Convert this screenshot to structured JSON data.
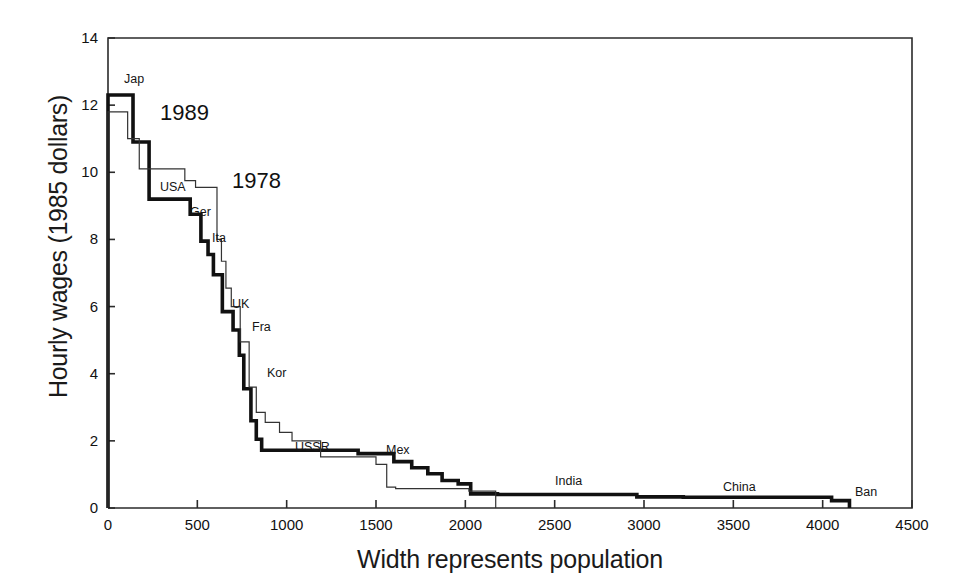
{
  "figure": {
    "background": "#ffffff",
    "frame_color": "#2b2b2b",
    "series_1989_color": "#111111",
    "series_1978_color": "#333333"
  },
  "axes": {
    "y_title": "Hourly wages (1985 dollars)",
    "x_title": "Width represents population",
    "y_ticks": [
      "0",
      "2",
      "4",
      "6",
      "8",
      "10",
      "12",
      "14"
    ],
    "x_ticks": [
      "0",
      "500",
      "1000",
      "1500",
      "2000",
      "2500",
      "3000",
      "3500",
      "4000",
      "4500"
    ]
  },
  "annotations": {
    "series_labels": [
      {
        "text": "1989",
        "x": 160,
        "y": 100
      },
      {
        "text": "1978",
        "x": 232,
        "y": 168
      }
    ],
    "country_labels": [
      {
        "text": "Jap",
        "x": 124,
        "y": 72
      },
      {
        "text": "USA",
        "x": 160,
        "y": 180
      },
      {
        "text": "Ger",
        "x": 190,
        "y": 205
      },
      {
        "text": "Ita",
        "x": 212,
        "y": 231
      },
      {
        "text": "UK",
        "x": 232,
        "y": 297
      },
      {
        "text": "Fra",
        "x": 252,
        "y": 320
      },
      {
        "text": "Kor",
        "x": 267,
        "y": 366
      },
      {
        "text": "USSR",
        "x": 295,
        "y": 440
      },
      {
        "text": "Mex",
        "x": 386,
        "y": 443
      },
      {
        "text": "India",
        "x": 555,
        "y": 474
      },
      {
        "text": "China",
        "x": 723,
        "y": 480
      },
      {
        "text": "Ban",
        "x": 855,
        "y": 485
      }
    ]
  },
  "chart_data": {
    "type": "line",
    "title": "",
    "xlabel": "Width represents population",
    "ylabel": "Hourly wages (1985 dollars)",
    "xlim": [
      0,
      4500
    ],
    "ylim": [
      0,
      14
    ],
    "grid": false,
    "legend": "inline-annotation",
    "note": "Step (staircase) chart. Each horizontal run's width represents that country's population (millions of workers); its height is the hourly wage. Countries are ordered by descending wage.",
    "series": [
      {
        "name": "1989",
        "style": "thick",
        "steps": [
          {
            "label": "Jap",
            "x_start": 0,
            "x_end": 140,
            "wage": 12.3
          },
          {
            "label": "",
            "x_start": 140,
            "x_end": 230,
            "wage": 10.9
          },
          {
            "label": "USA",
            "x_start": 230,
            "x_end": 460,
            "wage": 9.2
          },
          {
            "label": "Ger",
            "x_start": 460,
            "x_end": 520,
            "wage": 8.75
          },
          {
            "label": "Ita",
            "x_start": 520,
            "x_end": 560,
            "wage": 7.95
          },
          {
            "label": "",
            "x_start": 560,
            "x_end": 590,
            "wage": 7.55
          },
          {
            "label": "",
            "x_start": 590,
            "x_end": 640,
            "wage": 6.95
          },
          {
            "label": "UK",
            "x_start": 640,
            "x_end": 700,
            "wage": 5.85
          },
          {
            "label": "Fra",
            "x_start": 700,
            "x_end": 735,
            "wage": 5.3
          },
          {
            "label": "",
            "x_start": 735,
            "x_end": 760,
            "wage": 4.55
          },
          {
            "label": "Kor",
            "x_start": 760,
            "x_end": 800,
            "wage": 3.55
          },
          {
            "label": "",
            "x_start": 800,
            "x_end": 830,
            "wage": 2.6
          },
          {
            "label": "",
            "x_start": 830,
            "x_end": 860,
            "wage": 2.05
          },
          {
            "label": "USSR",
            "x_start": 860,
            "x_end": 1400,
            "wage": 1.72
          },
          {
            "label": "Mex",
            "x_start": 1400,
            "x_end": 1600,
            "wage": 1.62
          },
          {
            "label": "",
            "x_start": 1600,
            "x_end": 1700,
            "wage": 1.38
          },
          {
            "label": "",
            "x_start": 1700,
            "x_end": 1790,
            "wage": 1.2
          },
          {
            "label": "",
            "x_start": 1790,
            "x_end": 1870,
            "wage": 1.02
          },
          {
            "label": "",
            "x_start": 1870,
            "x_end": 1960,
            "wage": 0.82
          },
          {
            "label": "",
            "x_start": 1960,
            "x_end": 2030,
            "wage": 0.72
          },
          {
            "label": "",
            "x_start": 2030,
            "x_end": 2180,
            "wage": 0.42
          },
          {
            "label": "India",
            "x_start": 2180,
            "x_end": 2960,
            "wage": 0.4
          },
          {
            "label": "",
            "x_start": 2960,
            "x_end": 3220,
            "wage": 0.33
          },
          {
            "label": "China",
            "x_start": 3220,
            "x_end": 4050,
            "wage": 0.32
          },
          {
            "label": "Ban",
            "x_start": 4050,
            "x_end": 4150,
            "wage": 0.22
          }
        ]
      },
      {
        "name": "1978",
        "style": "thin",
        "steps": [
          {
            "label": "",
            "x_start": 0,
            "x_end": 110,
            "wage": 11.8
          },
          {
            "label": "",
            "x_start": 110,
            "x_end": 175,
            "wage": 11.0
          },
          {
            "label": "",
            "x_start": 175,
            "x_end": 430,
            "wage": 10.1
          },
          {
            "label": "",
            "x_start": 430,
            "x_end": 490,
            "wage": 9.75
          },
          {
            "label": "",
            "x_start": 490,
            "x_end": 610,
            "wage": 9.55
          },
          {
            "label": "",
            "x_start": 610,
            "x_end": 635,
            "wage": 8.0
          },
          {
            "label": "",
            "x_start": 635,
            "x_end": 660,
            "wage": 7.35
          },
          {
            "label": "",
            "x_start": 660,
            "x_end": 690,
            "wage": 6.55
          },
          {
            "label": "",
            "x_start": 690,
            "x_end": 740,
            "wage": 6.0
          },
          {
            "label": "",
            "x_start": 740,
            "x_end": 790,
            "wage": 4.95
          },
          {
            "label": "",
            "x_start": 790,
            "x_end": 830,
            "wage": 3.6
          },
          {
            "label": "",
            "x_start": 830,
            "x_end": 880,
            "wage": 2.85
          },
          {
            "label": "",
            "x_start": 880,
            "x_end": 960,
            "wage": 2.55
          },
          {
            "label": "",
            "x_start": 960,
            "x_end": 1030,
            "wage": 2.25
          },
          {
            "label": "",
            "x_start": 1030,
            "x_end": 1190,
            "wage": 2.0
          },
          {
            "label": "",
            "x_start": 1190,
            "x_end": 1500,
            "wage": 1.52
          },
          {
            "label": "",
            "x_start": 1500,
            "x_end": 1560,
            "wage": 1.3
          },
          {
            "label": "",
            "x_start": 1560,
            "x_end": 1610,
            "wage": 0.62
          },
          {
            "label": "",
            "x_start": 1610,
            "x_end": 2020,
            "wage": 0.58
          },
          {
            "label": "",
            "x_start": 2020,
            "x_end": 2170,
            "wage": 0.5
          }
        ]
      }
    ]
  }
}
